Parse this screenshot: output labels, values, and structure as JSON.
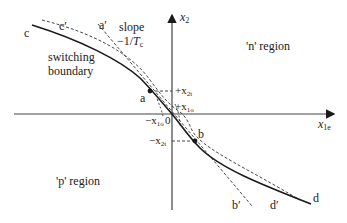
{
  "diagram": {
    "type": "phase-plane switching boundary",
    "axes": {
      "x_label": "x",
      "x_label_sub": "1e",
      "y_label": "x",
      "y_label_sub": "2",
      "origin_label": "0"
    },
    "regions": {
      "n": "'n' region",
      "p": "'p' region"
    },
    "curve_labels": {
      "start": "c",
      "start_prime": "c′",
      "end": "d",
      "end_prime": "d′",
      "tangent_top": "a′",
      "tangent_bottom": "b′"
    },
    "points": {
      "a": "a",
      "b": "b"
    },
    "tick_labels": {
      "plus_x2t": "+x",
      "plus_x2t_sub": "2t",
      "plus_x1o": "+x",
      "plus_x1o_sub": "1o",
      "minus_x1o": "−x",
      "minus_x1o_sub": "1o",
      "minus_x2t": "−x",
      "minus_x2t_sub": "2t"
    },
    "annotations": {
      "slope_line1": "slope",
      "slope_line2_prefix": "−1/",
      "slope_line2_T": "T",
      "slope_line2_sub": "c",
      "boundary_line1": "switching",
      "boundary_line2": "boundary"
    },
    "colors": {
      "line": "#1a1a1a",
      "dashed": "#333333",
      "axis": "#444444"
    }
  }
}
